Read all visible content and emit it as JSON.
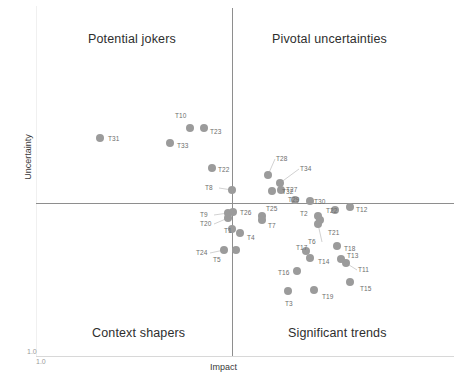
{
  "chart_data": {
    "type": "scatter",
    "title": "",
    "xlabel": "Impact",
    "ylabel": "Uncertainty",
    "xlim": [
      1.0,
      5.0
    ],
    "ylim": [
      1.0,
      5.0
    ],
    "grid": false,
    "legend": "none",
    "x_tick_labels": [
      "1.0"
    ],
    "y_tick_labels": [
      "1.0"
    ],
    "quadrants": [
      {
        "key": "top_left",
        "label": "Potential jokers"
      },
      {
        "key": "top_right",
        "label": "Pivotal uncertainties"
      },
      {
        "key": "bottom_left",
        "label": "Context shapers"
      },
      {
        "key": "bottom_right",
        "label": "Significant trends"
      }
    ],
    "marker_color": "#9b9b9b",
    "axis_color": "#8e8e8e",
    "points": [
      {
        "id": "T31",
        "px": 100,
        "py": 138,
        "lx": 108,
        "ly": 135,
        "leader": false
      },
      {
        "id": "T10",
        "px": 190,
        "py": 128,
        "lx": 175,
        "ly": 112,
        "leader": false
      },
      {
        "id": "T23",
        "px": 204,
        "py": 128,
        "lx": 210,
        "ly": 128,
        "leader": false
      },
      {
        "id": "T33",
        "px": 170,
        "py": 143,
        "lx": 177,
        "ly": 142,
        "leader": false
      },
      {
        "id": "T22a",
        "px": 212,
        "py": 168,
        "lx": 218,
        "ly": 166,
        "leader": false
      },
      {
        "id": "T8",
        "px": 232,
        "py": 190,
        "lx": 205,
        "ly": 184,
        "leader": true
      },
      {
        "id": "T28",
        "px": 268,
        "py": 175,
        "lx": 276,
        "ly": 155,
        "leader": true
      },
      {
        "id": "T34",
        "px": 280,
        "py": 183,
        "lx": 300,
        "ly": 165,
        "leader": true
      },
      {
        "id": "T32",
        "px": 272,
        "py": 191,
        "lx": 282,
        "ly": 188,
        "leader": false
      },
      {
        "id": "T27",
        "px": 281,
        "py": 190,
        "lx": 286,
        "ly": 186,
        "leader": false
      },
      {
        "id": "T29",
        "px": 295,
        "py": 200,
        "lx": 288,
        "ly": 196,
        "leader": false
      },
      {
        "id": "T30",
        "px": 310,
        "py": 201,
        "lx": 314,
        "ly": 198,
        "leader": false
      },
      {
        "id": "T9",
        "px": 228,
        "py": 213,
        "lx": 200,
        "ly": 211,
        "leader": true
      },
      {
        "id": "T20",
        "px": 228,
        "py": 218,
        "lx": 200,
        "ly": 220,
        "leader": true
      },
      {
        "id": "T26",
        "px": 233,
        "py": 212,
        "lx": 240,
        "ly": 209,
        "leader": false
      },
      {
        "id": "T25",
        "px": 262,
        "py": 216,
        "lx": 266,
        "ly": 205,
        "leader": false
      },
      {
        "id": "T7",
        "px": 262,
        "py": 220,
        "lx": 268,
        "ly": 222,
        "leader": false
      },
      {
        "id": "T2",
        "px": 318,
        "py": 216,
        "lx": 300,
        "ly": 210,
        "leader": false
      },
      {
        "id": "T22",
        "px": 335,
        "py": 210,
        "lx": 326,
        "ly": 207,
        "leader": false
      },
      {
        "id": "T12",
        "px": 350,
        "py": 207,
        "lx": 356,
        "ly": 206,
        "leader": false
      },
      {
        "id": "T21",
        "px": 320,
        "py": 220,
        "lx": 328,
        "ly": 229,
        "leader": false
      },
      {
        "id": "T6",
        "px": 318,
        "py": 224,
        "lx": 308,
        "ly": 238,
        "leader": true
      },
      {
        "id": "T1",
        "px": 232,
        "py": 229,
        "lx": 224,
        "ly": 227,
        "leader": false
      },
      {
        "id": "T4",
        "px": 240,
        "py": 233,
        "lx": 247,
        "ly": 234,
        "leader": false
      },
      {
        "id": "T24",
        "px": 224,
        "py": 250,
        "lx": 196,
        "ly": 249,
        "leader": true
      },
      {
        "id": "T5",
        "px": 236,
        "py": 250,
        "lx": 213,
        "ly": 256,
        "leader": false
      },
      {
        "id": "T17",
        "px": 306,
        "py": 251,
        "lx": 296,
        "ly": 244,
        "leader": false
      },
      {
        "id": "T18",
        "px": 337,
        "py": 246,
        "lx": 344,
        "ly": 245,
        "leader": false
      },
      {
        "id": "T14",
        "px": 310,
        "py": 258,
        "lx": 318,
        "ly": 258,
        "leader": false
      },
      {
        "id": "T13",
        "px": 341,
        "py": 259,
        "lx": 347,
        "ly": 252,
        "leader": false
      },
      {
        "id": "T11",
        "px": 346,
        "py": 263,
        "lx": 358,
        "ly": 266,
        "leader": true
      },
      {
        "id": "T16",
        "px": 297,
        "py": 271,
        "lx": 278,
        "ly": 269,
        "leader": false
      },
      {
        "id": "T15",
        "px": 350,
        "py": 282,
        "lx": 360,
        "ly": 285,
        "leader": false
      },
      {
        "id": "T19",
        "px": 314,
        "py": 290,
        "lx": 322,
        "ly": 293,
        "leader": false
      },
      {
        "id": "T3",
        "px": 288,
        "py": 291,
        "lx": 285,
        "ly": 300,
        "leader": false
      }
    ]
  },
  "caption": ""
}
